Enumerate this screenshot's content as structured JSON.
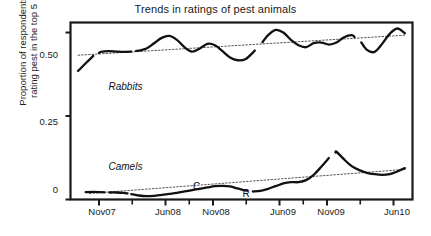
{
  "chart_data": {
    "type": "line",
    "title": "Trends in ratings of pest animals",
    "xlabel": "",
    "ylabel": "Proportion of respondents rating pest in the top 5",
    "ylabel_line1": "Proportion of respondents",
    "ylabel_line2": "rating pest in the top 5",
    "ylim": [
      0,
      0.53
    ],
    "yticks": [
      "0",
      "0.25",
      "0.50"
    ],
    "ytick_values": [
      0,
      0.25,
      0.5
    ],
    "xticks": [
      "Nov07",
      "Jun08",
      "Nov08",
      "Jun09",
      "Nov09",
      "Jun10"
    ],
    "xtick_values": [
      3,
      10,
      15,
      22,
      27,
      34
    ],
    "xlim": [
      0,
      36
    ],
    "grid": false,
    "legend": "inline-labels",
    "frame": "box",
    "series": [
      {
        "name": "Rabbits",
        "label_x": 4,
        "label_y": 0.335,
        "style": "solid-smooth-broken",
        "x": [
          0.8,
          1.6,
          2.4,
          3.2,
          4.0,
          4.8,
          5.6,
          6.4,
          7.2,
          8.0,
          8.8,
          9.6,
          10.4,
          11.2,
          12.0,
          12.8,
          13.6,
          14.4,
          15.2,
          16.0,
          16.8,
          17.6,
          18.4,
          19.2,
          20.0,
          20.8,
          21.6,
          22.4,
          23.2,
          24.0,
          24.8,
          25.6,
          26.4,
          27.2,
          28.0,
          28.8,
          29.6,
          30.4,
          31.2,
          32.0,
          32.8,
          33.6,
          34.4,
          35.2
        ],
        "values": [
          0.385,
          0.408,
          0.43,
          0.442,
          0.444,
          0.443,
          0.442,
          0.443,
          0.446,
          0.452,
          0.468,
          0.484,
          0.49,
          0.478,
          0.456,
          0.443,
          0.452,
          0.466,
          0.462,
          0.444,
          0.425,
          0.417,
          0.42,
          0.44,
          0.464,
          0.492,
          0.508,
          0.5,
          0.478,
          0.462,
          0.456,
          0.468,
          0.47,
          0.464,
          0.47,
          0.486,
          0.492,
          0.478,
          0.448,
          0.442,
          0.466,
          0.496,
          0.512,
          0.498
        ],
        "breaks": [
          [
            0.8,
            2.4
          ],
          [
            3.0,
            6.4
          ],
          [
            6.9,
            19.4
          ],
          [
            20.2,
            29.9
          ],
          [
            30.6,
            35.2
          ]
        ],
        "trend": {
          "x0": 0.8,
          "y0": 0.432,
          "x1": 35.2,
          "y1": 0.492,
          "style": "dotted"
        }
      },
      {
        "name": "Camels",
        "label_x": 4,
        "label_y": 0.095,
        "style": "solid-smooth-broken",
        "x": [
          1.6,
          2.4,
          3.2,
          4.0,
          4.8,
          5.6,
          6.4,
          7.2,
          8.0,
          8.8,
          9.6,
          10.4,
          11.2,
          12.0,
          12.8,
          13.6,
          14.4,
          15.2,
          16.0,
          16.8,
          17.6,
          18.4,
          19.2,
          20.0,
          20.8,
          21.6,
          22.4,
          23.2,
          24.0,
          24.8,
          25.6,
          26.4,
          27.2,
          28.0,
          28.8,
          29.6,
          30.4,
          31.2,
          32.0,
          32.8,
          33.6,
          34.4,
          35.2
        ],
        "values": [
          0.022,
          0.023,
          0.022,
          0.021,
          0.021,
          0.02,
          0.016,
          0.012,
          0.01,
          0.011,
          0.014,
          0.017,
          0.02,
          0.024,
          0.028,
          0.032,
          0.036,
          0.04,
          0.041,
          0.039,
          0.033,
          0.027,
          0.024,
          0.026,
          0.032,
          0.04,
          0.048,
          0.052,
          0.052,
          0.058,
          0.074,
          0.098,
          0.124,
          0.143,
          0.12,
          0.1,
          0.088,
          0.08,
          0.076,
          0.074,
          0.076,
          0.084,
          0.094
        ],
        "breaks": [
          [
            1.6,
            3.6
          ],
          [
            4.1,
            6.0
          ],
          [
            6.4,
            18.6
          ],
          [
            19.2,
            27.2
          ],
          [
            27.9,
            35.2
          ]
        ],
        "trend": {
          "x0": 2.0,
          "y0": 0.018,
          "x1": 35.2,
          "y1": 0.09,
          "style": "dotted"
        },
        "annotations": [
          {
            "text": "C",
            "x": 12.9,
            "y": 0.038
          },
          {
            "text": "R",
            "x": 18.1,
            "y": 0.017
          }
        ]
      }
    ]
  }
}
